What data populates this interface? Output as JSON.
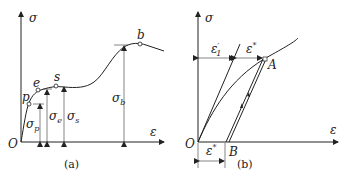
{
  "figure_a": {
    "y_axis": "σ",
    "x_axis": "ε",
    "origin": "O",
    "points": {
      "p": "p",
      "e": "e",
      "s": "s",
      "b": "b"
    },
    "stresses": {
      "sigma_p": {
        "base": "σ",
        "sub": "p"
      },
      "sigma_e": {
        "base": "σ",
        "sub": "e"
      },
      "sigma_s": {
        "base": "σ",
        "sub": "s"
      },
      "sigma_b": {
        "base": "σ",
        "sub": "b"
      }
    },
    "caption": "(a)"
  },
  "figure_b": {
    "y_axis": "σ",
    "x_axis": "ε",
    "origin": "O",
    "point_A": "A",
    "point_B": "B",
    "strain_elastic": {
      "base": "ε",
      "sup": "′",
      "sub": "1"
    },
    "strain_plastic_top": {
      "base": "ε",
      "sup": "*"
    },
    "strain_plastic_bottom": {
      "base": "ε",
      "sup": "*"
    },
    "caption": "(b)"
  }
}
